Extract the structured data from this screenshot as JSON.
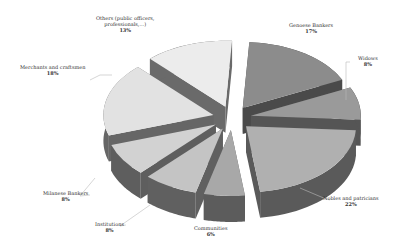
{
  "chart_data": {
    "type": "pie",
    "style": "3d-exploded",
    "title": "",
    "categories": [
      "Genoese Bankers",
      "Widows",
      "Nobles and patricians",
      "Communities",
      "Institutions",
      "Milanese Bankers",
      "Merchants and craftsmen",
      "Others (public officers, professionals,...)"
    ],
    "values": [
      17,
      8,
      22,
      6,
      8,
      8,
      18,
      13
    ],
    "labels": [
      {
        "name": "Genoese Bankers",
        "pct": "17%"
      },
      {
        "name": "Widows",
        "pct": "8%"
      },
      {
        "name": "Nobles and patricians",
        "pct": "22%"
      },
      {
        "name": "Communities",
        "pct": "6%"
      },
      {
        "name": "Institutions",
        "pct": "8%"
      },
      {
        "name": "Milanese Bankers",
        "pct": "8%"
      },
      {
        "name": "Merchants and craftsmen",
        "pct": "18%"
      },
      {
        "name": "Others (public officers,",
        "name2": "professionals,...)",
        "pct": "13%"
      }
    ],
    "colors_top": [
      "#8c8c8c",
      "#9a9a9a",
      "#b0b0b0",
      "#a8a8a8",
      "#c4c4c4",
      "#d2d2d2",
      "#e2e2e2",
      "#ececec"
    ],
    "colors_side": [
      "#4a4a4a",
      "#555555",
      "#5a5a5a",
      "#5c5c5c",
      "#606060",
      "#5e5e5e",
      "#666666",
      "#6a6a6a"
    ],
    "legend": "none (data labels with leader lines)"
  }
}
